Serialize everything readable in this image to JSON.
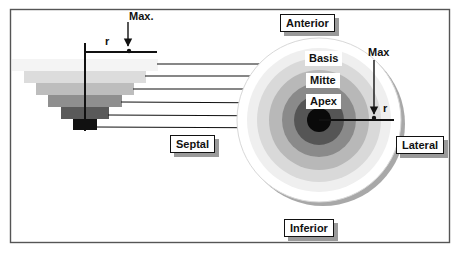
{
  "diagram": {
    "frame": {
      "x": 10,
      "y": 9,
      "width": 439,
      "height": 234,
      "color": "#555555"
    },
    "labels": {
      "anterior": "Anterior",
      "inferior": "Inferior",
      "septal": "Septal",
      "lateral": "Lateral"
    },
    "zones": {
      "basis": "Basis",
      "mitte": "Mitte",
      "apex": "Apex"
    },
    "left_axis": {
      "max_label": "Max.",
      "r_label": "r"
    },
    "right_axis": {
      "max_label": "Max",
      "r_label": "r"
    },
    "stacked_bars": [
      {
        "level": 1,
        "x": 12,
        "y": 59,
        "w": 146,
        "h": 12,
        "color": "#f4f4f4"
      },
      {
        "level": 2,
        "x": 24,
        "y": 71,
        "w": 122,
        "h": 12,
        "color": "#dcdcdc"
      },
      {
        "level": 3,
        "x": 36,
        "y": 83,
        "w": 98,
        "h": 12,
        "color": "#bdbdbd"
      },
      {
        "level": 4,
        "x": 48,
        "y": 95,
        "w": 74,
        "h": 12,
        "color": "#8f8f8f"
      },
      {
        "level": 5,
        "x": 61,
        "y": 107,
        "w": 48,
        "h": 12,
        "color": "#5a5a5a"
      },
      {
        "level": 6,
        "x": 73,
        "y": 119,
        "w": 24,
        "h": 11,
        "color": "#111111"
      }
    ],
    "rings": [
      {
        "r": 82,
        "color": "#ffffff",
        "stroke": "#d8d8d8"
      },
      {
        "r": 72,
        "color": "#efefef"
      },
      {
        "r": 62,
        "color": "#d9d9d9"
      },
      {
        "r": 50,
        "color": "#b8b8b8"
      },
      {
        "r": 37,
        "color": "#8a8a8a"
      },
      {
        "r": 25,
        "color": "#555555"
      },
      {
        "r": 12,
        "color": "#0a0a0a"
      }
    ],
    "circle_center": {
      "x": 319,
      "y": 120
    }
  }
}
